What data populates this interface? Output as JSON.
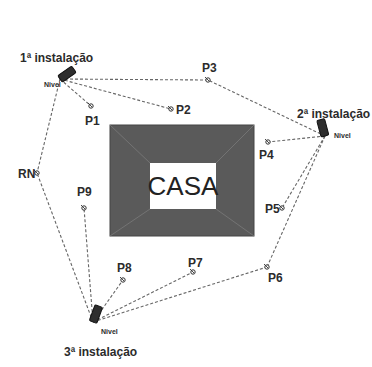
{
  "diagram": {
    "house": {
      "label": "CASA",
      "outer": {
        "x": 110,
        "y": 125,
        "w": 144,
        "h": 111
      },
      "inner": {
        "x": 150,
        "y": 163,
        "w": 66,
        "h": 46
      },
      "fill": "#5a5a5a"
    },
    "installations": [
      {
        "id": "inst1",
        "label": "1ª instalação",
        "nivel_label": "Nivel",
        "x": 60,
        "y": 79,
        "label_x": 20,
        "label_y": 62,
        "nivel_x": 44,
        "nivel_y": 87,
        "angle": 55
      },
      {
        "id": "inst2",
        "label": "2ª instalação",
        "nivel_label": "Nivel",
        "x": 325,
        "y": 136,
        "label_x": 297,
        "label_y": 118,
        "nivel_x": 334,
        "nivel_y": 138,
        "angle": -15
      },
      {
        "id": "inst3",
        "label": "3ª instalação",
        "nivel_label": "Nivel",
        "x": 93,
        "y": 322,
        "label_x": 64,
        "label_y": 356,
        "nivel_x": 101,
        "nivel_y": 334,
        "angle": 20
      }
    ],
    "points": [
      {
        "label": "P1",
        "x": 91,
        "y": 106,
        "label_x": 85,
        "label_y": 125
      },
      {
        "label": "P2",
        "x": 171,
        "y": 109,
        "label_x": 176,
        "label_y": 114
      },
      {
        "label": "P3",
        "x": 208,
        "y": 80,
        "label_x": 202,
        "label_y": 72
      },
      {
        "label": "P4",
        "x": 268,
        "y": 142,
        "label_x": 259,
        "label_y": 159
      },
      {
        "label": "P5",
        "x": 282,
        "y": 208,
        "label_x": 265,
        "label_y": 213
      },
      {
        "label": "P6",
        "x": 267,
        "y": 267,
        "label_x": 268,
        "label_y": 282
      },
      {
        "label": "P7",
        "x": 193,
        "y": 272,
        "label_x": 188,
        "label_y": 267
      },
      {
        "label": "P8",
        "x": 123,
        "y": 280,
        "label_x": 117,
        "label_y": 272
      },
      {
        "label": "P9",
        "x": 84,
        "y": 208,
        "label_x": 77,
        "label_y": 196
      },
      {
        "label": "RN",
        "x": 37,
        "y": 173,
        "label_x": 18,
        "label_y": 178
      }
    ],
    "connections": [
      [
        "inst1",
        "P1"
      ],
      [
        "inst1",
        "P2"
      ],
      [
        "inst1",
        "P3"
      ],
      [
        "inst1",
        "RN"
      ],
      [
        "inst2",
        "P3"
      ],
      [
        "inst2",
        "P4"
      ],
      [
        "inst2",
        "P5"
      ],
      [
        "inst2",
        "P6"
      ],
      [
        "inst3",
        "RN"
      ],
      [
        "inst3",
        "P9"
      ],
      [
        "inst3",
        "P8"
      ],
      [
        "inst3",
        "P7"
      ],
      [
        "inst3",
        "P6"
      ]
    ]
  }
}
